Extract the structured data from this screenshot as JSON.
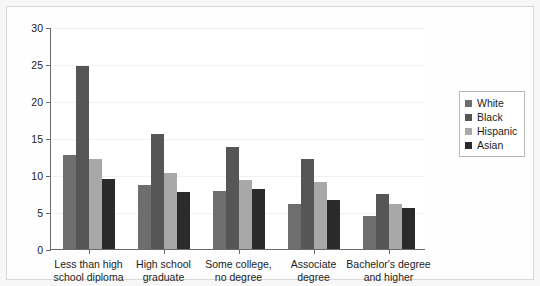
{
  "chart_data": {
    "type": "bar",
    "title": "",
    "subtitle": "",
    "xlabel": "",
    "ylabel": "",
    "ylim": [
      0,
      30
    ],
    "ytick_step": 5,
    "ytick_labels": [
      "30",
      "25",
      "20",
      "15",
      "10",
      "5",
      "0"
    ],
    "grid": true,
    "legend_position": "right",
    "categories": [
      "Less than high school diploma",
      "High school graduate",
      "Some college, no degree",
      "Associate degree",
      "Bachelor's degree and higher"
    ],
    "category_lines": [
      [
        "Less than high",
        "school diploma"
      ],
      [
        "High school",
        "graduate"
      ],
      [
        "Some college,",
        "no degree"
      ],
      [
        "Associate",
        "degree"
      ],
      [
        "Bachelor's degree",
        "and higher"
      ]
    ],
    "series": [
      {
        "name": "White",
        "color": "#6e6e6e",
        "values": [
          12.7,
          8.6,
          7.9,
          6.1,
          4.5
        ]
      },
      {
        "name": "Black",
        "color": "#565656",
        "values": [
          24.7,
          15.6,
          13.8,
          12.2,
          7.4
        ]
      },
      {
        "name": "Hispanic",
        "color": "#a8a8a8",
        "values": [
          12.1,
          10.3,
          9.3,
          9.0,
          6.1
        ]
      },
      {
        "name": "Asian",
        "color": "#2b2b2b",
        "values": [
          9.5,
          7.7,
          8.1,
          6.6,
          5.6
        ]
      }
    ]
  },
  "legend": {
    "entries": [
      {
        "label": "White",
        "color": "#6e6e6e"
      },
      {
        "label": "Black",
        "color": "#565656"
      },
      {
        "label": "Hispanic",
        "color": "#a8a8a8"
      },
      {
        "label": "Asian",
        "color": "#2b2b2b"
      }
    ]
  }
}
